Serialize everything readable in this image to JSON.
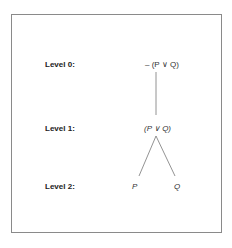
{
  "diagram": {
    "levels": [
      {
        "label": "Level 0:",
        "node": "– (P ∨ Q)"
      },
      {
        "label": "Level 1:",
        "node": "(P ∨ Q)"
      },
      {
        "label": "Level 2:",
        "nodes": [
          "P",
          "Q"
        ]
      }
    ],
    "edges": [
      {
        "from": "– (P ∨ Q)",
        "to": "(P ∨ Q)"
      },
      {
        "from": "(P ∨ Q)",
        "to": "P"
      },
      {
        "from": "(P ∨ Q)",
        "to": "Q"
      }
    ],
    "colors": {
      "border": "#8a8a8a",
      "line": "#777777",
      "text": "#222222"
    }
  }
}
